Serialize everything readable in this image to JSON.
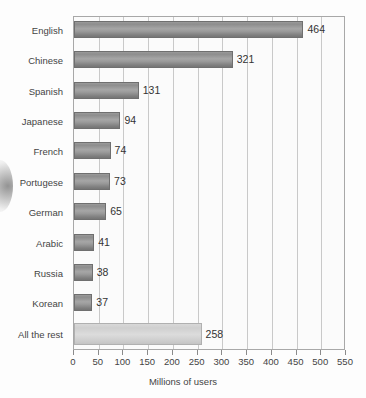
{
  "chart_data": {
    "type": "bar",
    "orientation": "horizontal",
    "title": "",
    "xlabel": "Millions of users",
    "ylabel": "",
    "xlim": [
      0,
      550
    ],
    "xticks": [
      0,
      50,
      100,
      150,
      200,
      250,
      300,
      350,
      400,
      450,
      500,
      550
    ],
    "grid": true,
    "legend": false,
    "categories": [
      "English",
      "Chinese",
      "Spanish",
      "Japanese",
      "French",
      "Portugese",
      "German",
      "Arabic",
      "Russia",
      "Korean",
      "All the rest"
    ],
    "values": [
      464,
      321,
      131,
      94,
      74,
      73,
      65,
      41,
      38,
      37,
      258
    ],
    "value_labels": [
      "464",
      "321",
      "131",
      "94",
      "74",
      "73",
      "65",
      "41",
      "38",
      "37",
      "258"
    ],
    "colors": {
      "bar": "#909090",
      "bar_highlight": "#d4d4d4",
      "plot_background": "#fbfbfb",
      "gridline": "#c9c9c9",
      "axis": "#8b8b8b",
      "text": "#3a3a3a"
    },
    "highlight_index": 10
  }
}
